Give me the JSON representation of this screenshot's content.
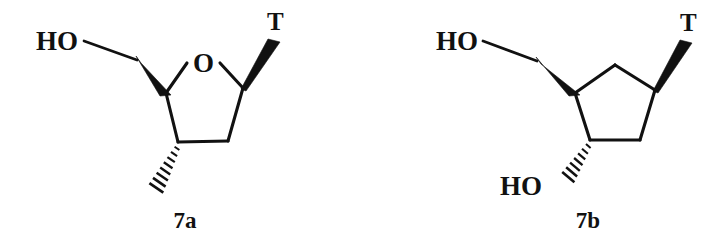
{
  "figure": {
    "type": "chemical-structure-diagram",
    "background_color": "#ffffff",
    "ink_color": "#111111",
    "structures": [
      {
        "id": "7a",
        "caption": "7a",
        "core_ring": "tetrahydrofuran",
        "ring_heteroatom_label": "O",
        "substituent_labels": {
          "hydroxymethyl": "HO",
          "base": "T",
          "methyl": ""
        },
        "bond_styles": {
          "hydroxymethyl": "bold-wedge",
          "base": "bold-wedge",
          "methyl": "hashed-wedge"
        }
      },
      {
        "id": "7b",
        "caption": "7b",
        "core_ring": "cyclopentane",
        "ring_heteroatom_label": "",
        "substituent_labels": {
          "hydroxymethyl": "HO",
          "base": "T",
          "hydroxyl": "HO"
        },
        "bond_styles": {
          "hydroxymethyl": "bold-wedge",
          "base": "bold-wedge",
          "hydroxyl": "hashed-wedge"
        }
      }
    ]
  },
  "struct_a": {
    "label_HO": "HO",
    "label_O": "O",
    "label_T": "T",
    "caption": "7a"
  },
  "struct_b": {
    "label_HO_top": "HO",
    "label_T": "T",
    "label_HO_bottom": "HO",
    "caption": "7b"
  }
}
